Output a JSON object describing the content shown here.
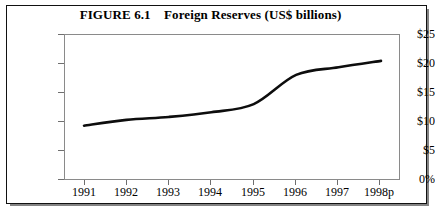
{
  "figure": {
    "title_prefix": "FIGURE 6.1",
    "title_text": "Foreign Reserves (US$ billions)",
    "title_full": "FIGURE 6.1    Foreign Reserves (US$ billions)"
  },
  "axes": {
    "y_tick_labels": [
      "$25",
      "$20",
      "$15",
      "$10",
      "$5",
      "0%"
    ],
    "x_tick_labels": [
      "1991",
      "1992",
      "1993",
      "1994",
      "1995",
      "1996",
      "1997",
      "1998p"
    ]
  },
  "colors": {
    "line": "#0d0d0d",
    "frame": "#111111",
    "plot_border": "#8a8a8a",
    "background": "#ffffff"
  },
  "chart_data": {
    "type": "line",
    "title": "FIGURE 6.1    Foreign Reserves (US$ billions)",
    "xlabel": "",
    "ylabel": "",
    "x": [
      "1991",
      "1992",
      "1993",
      "1994",
      "1995",
      "1996",
      "1997",
      "1998p"
    ],
    "categories": [
      "1991",
      "1992",
      "1993",
      "1994",
      "1995",
      "1996",
      "1997",
      "1998p"
    ],
    "values": [
      9.3,
      10.3,
      10.8,
      11.6,
      13.0,
      18.0,
      19.3,
      20.4
    ],
    "series": [
      {
        "name": "Foreign Reserves (US$ billions)",
        "values": [
          9.3,
          10.3,
          10.8,
          11.6,
          13.0,
          18.0,
          19.3,
          20.4
        ]
      }
    ],
    "ylim": [
      0,
      25
    ],
    "ytick_values": [
      0,
      5,
      10,
      15,
      20,
      25
    ],
    "ytick_labels": [
      "0%",
      "$5",
      "$10",
      "$15",
      "$20",
      "$25"
    ],
    "grid": false,
    "legend": "none",
    "units": "US$ billions",
    "note": "1998p denotes provisional figure"
  }
}
